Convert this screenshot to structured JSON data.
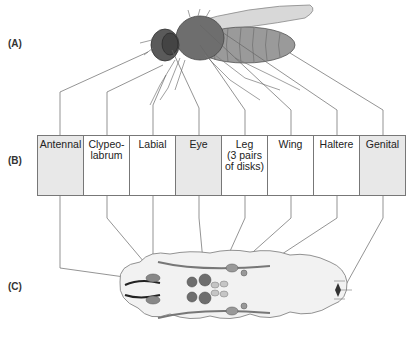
{
  "panels": {
    "a": {
      "label": "(A)",
      "subject": "adult fly"
    },
    "b": {
      "label": "(B)",
      "subject": "imaginal disks"
    },
    "c": {
      "label": "(C)",
      "subject": "larva"
    }
  },
  "disks": [
    {
      "label": "Antennal",
      "shade": "gray"
    },
    {
      "label": "Clypeo-\nlabrum",
      "shade": "white"
    },
    {
      "label": "Labial",
      "shade": "white"
    },
    {
      "label": "Eye",
      "shade": "gray"
    },
    {
      "label": "Leg\n(3 pairs\nof disks)",
      "shade": "white"
    },
    {
      "label": "Wing",
      "shade": "white"
    },
    {
      "label": "Haltere",
      "shade": "white"
    },
    {
      "label": "Genital",
      "shade": "gray"
    }
  ],
  "colors": {
    "line": "#666666",
    "disk_fill": "#8a8a8a",
    "larva_fill": "#f2f2f2",
    "gray_cell": "#e8e8e8"
  }
}
